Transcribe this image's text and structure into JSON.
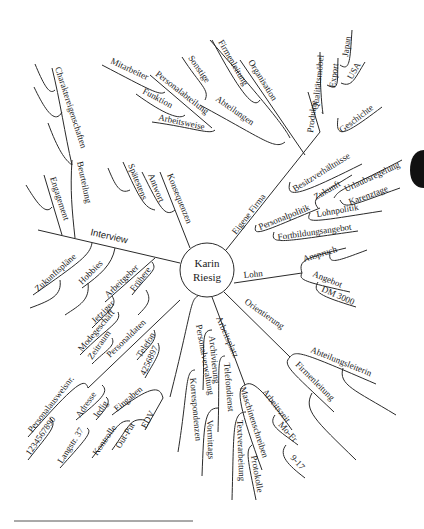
{
  "center": {
    "line1": "Karin",
    "line2": "Riesig"
  },
  "branches": {
    "interview": {
      "label": "Interview",
      "beurteilung": "Beurteilung",
      "engagement": "Engagement",
      "charakter": "Charaktereigenschaften",
      "zukunft": "Zukunftspläne",
      "hobbies": "Hobbies",
      "arbeitgeber": "Arbeitgeber",
      "fruehere": "Frühere",
      "jetziger": "Jetziger",
      "modegeschaeft": "Modegeschäft",
      "zeitraum": "Zeitraum"
    },
    "konsequenzen": {
      "label": "Konsequenzen",
      "antwort": "Antwort",
      "spaetestens": "Spätestens"
    },
    "organisation": {
      "label": "Organisation",
      "firmenleitung": "Firmenleitung",
      "abteilungen": "Abteilungen",
      "sonstige": "Sonstige",
      "personalabteilung": "Personalabteilung",
      "mitarbeiter": "Mitarbeiter",
      "funktion": "Funktion",
      "arbeitsweise": "Arbeitsweise"
    },
    "eigene_firma": {
      "label": "Eigene Firma",
      "produkte": "Produkte",
      "qualitaetsmoebel": "Qualitätsmöbel",
      "export": "Export",
      "japan": "Japan",
      "usa": "USA",
      "geschichte": "Geschichte",
      "besitz": "Besitzverhältnisse",
      "personalpolitik": "Personalpolitik",
      "zukunft": "Zukunft",
      "urlaub": "Urlaubsregelung",
      "karenz": "Karenztage",
      "lohnpolitik": "Lohnpolitik",
      "fortbildung": "Fortbildungsangebot"
    },
    "lohn": {
      "label": "Lohn",
      "anspruch": "Anspruch",
      "angebot": "Angebot",
      "dm": "DM 3000"
    },
    "orientierung": {
      "label": "Orientierung",
      "abteilungsleiterin": "Abteilungsleiterin",
      "firmenleitung": "Firmenleitung"
    },
    "arbeitsplatz": {
      "label": "Arbeitsplatz",
      "arbeitszeit": "Arbeitszeit",
      "mofr": "Mo-Fr",
      "zeit": "9-17",
      "maschinenschreiben": "Maschinenschreiben",
      "textverarbeitung": "Textverarbeitung",
      "protokolle": "Protokolle",
      "telefondienst": "Telefondienst",
      "vormittags": "Vormittags",
      "archivierung": "Archivierung"
    },
    "personalverwaltung": {
      "label": "Personalverwaltung",
      "korrespondenzen": "Korrespondenzen",
      "eingaben": "Eingaben",
      "edv": "EDV",
      "output": "Out-Put",
      "kontrolle": "Kontrolle",
      "personaldaten": "Personaldaten",
      "telefon": "Telefon",
      "telnr": "4256897",
      "adresse": "Adresse",
      "ledig": "ledig",
      "strasse": "Langstr. 37",
      "ausweis": "Personalausweisnr.",
      "ausweisnr": "1234567890"
    }
  }
}
